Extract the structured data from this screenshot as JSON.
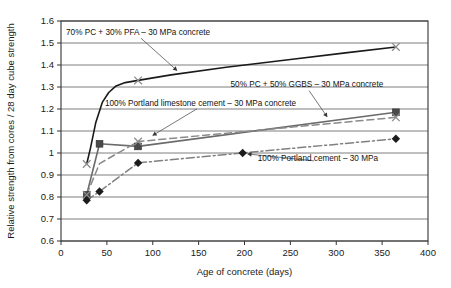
{
  "chart_data": {
    "type": "line",
    "title": "",
    "subtitle": "",
    "xlabel": "Age of concrete (days)",
    "ylabel": "Relative strength from cores / 28 day cube strength",
    "xlim": [
      0,
      400
    ],
    "ylim": [
      0.6,
      1.6
    ],
    "xticks": [
      0,
      50,
      100,
      150,
      200,
      250,
      300,
      350,
      400
    ],
    "xtick_labels": [
      "0",
      "50",
      "100",
      "150",
      "200",
      "250",
      "300",
      "350",
      "400"
    ],
    "yticks": [
      0.6,
      0.7,
      0.8,
      0.9,
      1.0,
      1.1,
      1.2,
      1.3,
      1.4,
      1.5,
      1.6
    ],
    "ytick_labels": [
      "0.6",
      "0.7",
      "0.8",
      "0.9",
      "1",
      "1.1",
      "1.2",
      "1.3",
      "1.4",
      "1.5",
      "1.6"
    ],
    "grid": "horizontal",
    "legend_position": "inline-annotations",
    "series": [
      {
        "name": "70% PC + 30% PFA – 30 MPa concrete",
        "style": "solid",
        "color": "#1a1a1a",
        "marker": "cross",
        "x": [
          28,
          32,
          38,
          45,
          52,
          60,
          70,
          84,
          120,
          180,
          250,
          310,
          365
        ],
        "y": [
          0.95,
          1.02,
          1.14,
          1.23,
          1.275,
          1.305,
          1.32,
          1.33,
          1.355,
          1.39,
          1.425,
          1.455,
          1.482
        ],
        "marker_points": [
          {
            "x": 28,
            "y": 0.95
          },
          {
            "x": 84,
            "y": 1.33
          },
          {
            "x": 365,
            "y": 1.482
          }
        ]
      },
      {
        "name": "50% PC + 50% GGBS – 30 MPa concrete",
        "style": "solid",
        "color": "#6b6b6b",
        "marker": "square",
        "x": [
          28,
          42,
          84,
          365
        ],
        "y": [
          0.81,
          1.042,
          1.03,
          1.185
        ],
        "marker_points": [
          {
            "x": 28,
            "y": 0.81
          },
          {
            "x": 42,
            "y": 1.042
          },
          {
            "x": 84,
            "y": 1.03
          },
          {
            "x": 365,
            "y": 1.185
          }
        ]
      },
      {
        "name": "100% Portland limestone cement – 30 MPa concrete",
        "style": "dashed",
        "color": "#8a8a8a",
        "marker": "cross",
        "x": [
          28,
          42,
          84,
          365
        ],
        "y": [
          0.81,
          0.952,
          1.052,
          1.162
        ],
        "marker_points": [
          {
            "x": 28,
            "y": 0.81
          },
          {
            "x": 84,
            "y": 1.052
          },
          {
            "x": 365,
            "y": 1.162
          }
        ]
      },
      {
        "name": "100% Portland cement – 30 MPa",
        "style": "dash-dot",
        "color": "#808080",
        "marker": "diamond",
        "x": [
          28,
          42,
          84,
          198,
          365
        ],
        "y": [
          0.785,
          0.825,
          0.955,
          1.0,
          1.065
        ],
        "marker_points": [
          {
            "x": 28,
            "y": 0.785
          },
          {
            "x": 42,
            "y": 0.825
          },
          {
            "x": 84,
            "y": 0.955
          },
          {
            "x": 198,
            "y": 1.0
          },
          {
            "x": 365,
            "y": 1.065
          }
        ]
      }
    ],
    "annotations": [
      {
        "text": "70% PC + 30% PFA – 30 MPa concrete",
        "label_x": 84,
        "label_y": 1.537,
        "target_x": 129,
        "target_y": 1.365
      },
      {
        "text": "50% PC + 50% GGBS – 30 MPa concrete",
        "label_x": 268,
        "label_y": 1.302,
        "target_x": 292,
        "target_y": 1.152
      },
      {
        "text": "100% Portland limestone cement – 30 MPa concrete",
        "label_x": 152,
        "label_y": 1.213,
        "target_x": 97,
        "target_y": 1.072
      },
      {
        "text": "100% Portland cement – 30 MPa",
        "label_x": 280,
        "label_y": 0.962,
        "target_x": 200,
        "target_y": 0.997
      }
    ]
  },
  "colors": {
    "axis": "#333333",
    "grid": "#6f6f6f",
    "text": "#1a1a1a",
    "series_pfa": "#1a1a1a",
    "series_ggbs": "#6b6b6b",
    "series_limestone": "#8a8a8a",
    "series_pc": "#808080"
  }
}
